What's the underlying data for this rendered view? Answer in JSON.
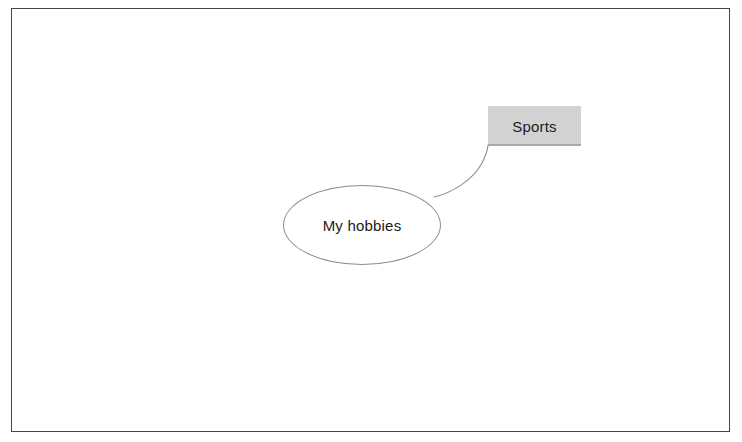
{
  "canvas": {
    "background_color": "#ffffff",
    "border_color": "#3a3a3e",
    "width": 742,
    "height": 442
  },
  "diagram": {
    "type": "mind-map",
    "root": {
      "id": "root",
      "label": "My hobbies",
      "shape": "ellipse",
      "fill_color": "#ffffff",
      "stroke_color": "#8d8d92",
      "text_color": "#1c1c1c",
      "x": 282,
      "y": 184,
      "width": 158,
      "height": 80
    },
    "nodes": [
      {
        "id": "sports",
        "label": "Sports",
        "shape": "rectangle",
        "fill_color": "#d2d2d2",
        "stroke_color": "none",
        "text_color": "#1c1c1c",
        "x": 487,
        "y": 105,
        "width": 93,
        "height": 40
      }
    ],
    "connectors": [
      {
        "id": "root-to-sports",
        "from": "root",
        "to": "sports",
        "style": "curve",
        "stroke_color": "#8d8d92",
        "stroke_width": 1
      }
    ]
  }
}
